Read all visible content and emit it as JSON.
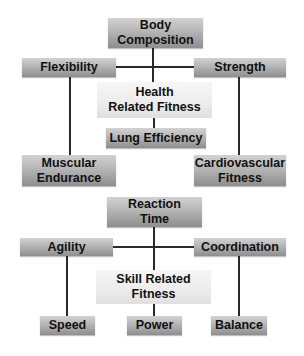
{
  "diagram": {
    "health": {
      "center": {
        "line1": "Health",
        "line2": "Related Fitness"
      },
      "top": {
        "line1": "Body",
        "line2": "Composition"
      },
      "left": {
        "label": "Flexibility"
      },
      "right": {
        "label": "Strength"
      },
      "below_center": {
        "label": "Lung Efficiency"
      },
      "bottom_left": {
        "line1": "Muscular",
        "line2": "Endurance"
      },
      "bottom_right": {
        "line1": "Cardiovascular",
        "line2": "Fitness"
      }
    },
    "skill": {
      "center": {
        "line1": "Skill Related",
        "line2": "Fitness"
      },
      "top": {
        "line1": "Reaction",
        "line2": "Time"
      },
      "left": {
        "label": "Agility"
      },
      "right": {
        "label": "Coordination"
      },
      "bottom_left": {
        "label": "Speed"
      },
      "bottom_center": {
        "label": "Power"
      },
      "bottom_right": {
        "label": "Balance"
      }
    },
    "colors": {
      "box_dark_top": "#d2d2d2",
      "box_dark_bottom": "#8e8e8e",
      "box_light": "#ececec",
      "line": "#2a2a2a",
      "text": "#111111"
    }
  }
}
